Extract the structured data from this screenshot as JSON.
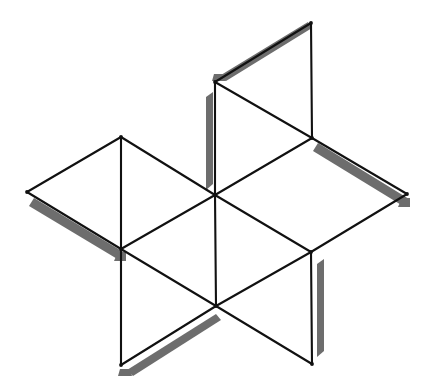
{
  "figure": {
    "canvas": {
      "width": 431,
      "height": 392
    },
    "colors": {
      "background": "#ffffff",
      "stroke": "#111111",
      "shadow": "#6d6d6d",
      "shadow_light": "#8a8a8a"
    },
    "stroke_width": 2.1,
    "vertices": {
      "top": {
        "label": "top-apex",
        "x": 311,
        "y": 23
      },
      "upper_left_node": {
        "label": "upper-left-node",
        "x": 215,
        "y": 82
      },
      "left_apex": {
        "label": "left-apex",
        "x": 121,
        "y": 137
      },
      "upper_right_node": {
        "label": "upper-right-node",
        "x": 312,
        "y": 138
      },
      "far_left": {
        "label": "far-left-apex",
        "x": 27,
        "y": 192
      },
      "center": {
        "label": "center-node",
        "x": 215,
        "y": 195
      },
      "far_right": {
        "label": "far-right-apex",
        "x": 407,
        "y": 194
      },
      "lower_left_node": {
        "label": "lower-left-node",
        "x": 121,
        "y": 249
      },
      "lower_right_node": {
        "label": "lower-right-node",
        "x": 311,
        "y": 252
      },
      "bottom_node": {
        "label": "bottom-node",
        "x": 216,
        "y": 306
      },
      "bottom_left": {
        "label": "bottom-left-apex",
        "x": 121,
        "y": 365
      },
      "bottom_right": {
        "label": "bottom-right-apex",
        "x": 312,
        "y": 364
      }
    },
    "edges": [
      {
        "name": "edge-top-to-upper-left",
        "from": "top",
        "to": "upper_left_node",
        "d": "M 311 23 L 215 82"
      },
      {
        "name": "edge-top-to-upper-right",
        "from": "top",
        "to": "upper_right_node",
        "d": "M 311 23 L 312 138"
      },
      {
        "name": "edge-upper-left-to-center",
        "from": "upper_left_node",
        "to": "center",
        "d": "M 215 82 L 215 195"
      },
      {
        "name": "edge-upper-left-to-upper-right",
        "from": "upper_left_node",
        "to": "upper_right_node",
        "d": "M 215 82 L 312 138"
      },
      {
        "name": "edge-upper-right-to-center",
        "from": "upper_right_node",
        "to": "center",
        "d": "M 312 138 L 215 195"
      },
      {
        "name": "edge-upper-right-to-far-right",
        "from": "upper_right_node",
        "to": "far_right",
        "d": "M 312 138 L 407 194"
      },
      {
        "name": "edge-far-right-to-lower-right",
        "from": "far_right",
        "to": "lower_right_node",
        "d": "M 407 194 L 311 252"
      },
      {
        "name": "edge-center-to-lower-right",
        "from": "center",
        "to": "lower_right_node",
        "d": "M 215 195 L 311 252"
      },
      {
        "name": "edge-left-apex-to-far-left",
        "from": "left_apex",
        "to": "far_left",
        "d": "M 121 137 L 27 192"
      },
      {
        "name": "edge-left-apex-to-center",
        "from": "left_apex",
        "to": "center",
        "d": "M 121 137 L 215 195"
      },
      {
        "name": "edge-left-apex-to-lower-left",
        "from": "left_apex",
        "to": "lower_left_node",
        "d": "M 121 137 L 121 249"
      },
      {
        "name": "edge-far-left-to-lower-left",
        "from": "far_left",
        "to": "lower_left_node",
        "d": "M 27 192 L 121 249"
      },
      {
        "name": "edge-lower-left-to-center",
        "from": "lower_left_node",
        "to": "center",
        "d": "M 121 249 L 215 195"
      },
      {
        "name": "edge-lower-left-to-bottom",
        "from": "lower_left_node",
        "to": "bottom_node",
        "d": "M 121 249 L 216 306"
      },
      {
        "name": "edge-center-to-bottom",
        "from": "center",
        "to": "bottom_node",
        "d": "M 215 195 L 216 306"
      },
      {
        "name": "edge-bottom-to-lower-right",
        "from": "bottom_node",
        "to": "lower_right_node",
        "d": "M 216 306 L 311 252"
      },
      {
        "name": "edge-bottom-to-bottom-left",
        "from": "bottom_node",
        "to": "bottom_left",
        "d": "M 216 306 L 121 365"
      },
      {
        "name": "edge-bottom-to-bottom-right",
        "from": "bottom_node",
        "to": "bottom_right",
        "d": "M 216 306 L 312 364"
      },
      {
        "name": "edge-lower-left-to-bottom-left",
        "from": "lower_left_node",
        "to": "bottom_left",
        "d": "M 121 249 L 121 365"
      },
      {
        "name": "edge-lower-right-to-bottom-right",
        "from": "lower_right_node",
        "to": "bottom_right",
        "d": "M 311 252 L 312 364"
      }
    ],
    "shadows": [
      {
        "name": "shadow-top-left-edge",
        "d": "M 221 75 L 308 22 L 312 28 L 226 81 Z"
      },
      {
        "name": "shadow-top-left-edge-cap",
        "d": "M 214 74 L 224 74 L 226 81 L 212 81 Z"
      },
      {
        "name": "shadow-upper-vertical-edge",
        "d": "M 206 97 L 213 92 L 213 184 L 206 190 Z"
      },
      {
        "name": "shadow-far-left-edge",
        "d": "M 34 198 L 125 253 L 119 260 L 29 206 Z"
      },
      {
        "name": "shadow-far-left-cap",
        "d": "M 118 252 L 126 252 L 126 261 L 114 261 Z"
      },
      {
        "name": "shadow-upper-right-edge",
        "d": "M 318 143 L 409 199 L 403 206 L 313 151 Z"
      },
      {
        "name": "shadow-upper-right-cap",
        "d": "M 402 198 L 410 198 L 410 207 L 398 207 Z"
      },
      {
        "name": "shadow-lower-right-vertical",
        "d": "M 317 264 L 324 259 L 324 351 L 317 357 Z"
      },
      {
        "name": "shadow-bottom-left-edge",
        "d": "M 127 370 L 216 314 L 221 320 L 133 376 Z"
      },
      {
        "name": "shadow-bottom-left-cap",
        "d": "M 120 369 L 130 369 L 132 376 L 118 376 Z"
      }
    ]
  }
}
